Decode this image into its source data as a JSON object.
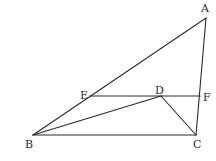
{
  "diagram": {
    "type": "geometry-triangle",
    "points": {
      "A": {
        "label": "A",
        "x": 206,
        "y": 18,
        "lx": 201,
        "ly": 12
      },
      "B": {
        "label": "B",
        "x": 33,
        "y": 135,
        "lx": 25,
        "ly": 148
      },
      "C": {
        "label": "C",
        "x": 196,
        "y": 135,
        "lx": 193,
        "ly": 148
      },
      "D": {
        "label": "D",
        "x": 161,
        "y": 96,
        "lx": 155,
        "ly": 94
      },
      "E": {
        "label": "E",
        "x": 90,
        "y": 96,
        "lx": 80,
        "ly": 99
      },
      "F": {
        "label": "F",
        "x": 200,
        "y": 96,
        "lx": 203,
        "ly": 101
      }
    },
    "segments": [
      {
        "name": "AB",
        "from": "A",
        "to": "B"
      },
      {
        "name": "AC",
        "from": "A",
        "to": "C"
      },
      {
        "name": "BC",
        "from": "B",
        "to": "C"
      },
      {
        "name": "EF",
        "from": "E",
        "to": "F"
      },
      {
        "name": "BD",
        "from": "B",
        "to": "D"
      },
      {
        "name": "DC",
        "from": "D",
        "to": "C"
      }
    ],
    "colors": {
      "stroke": "#2a2a2a",
      "background": "#ffffff"
    }
  }
}
